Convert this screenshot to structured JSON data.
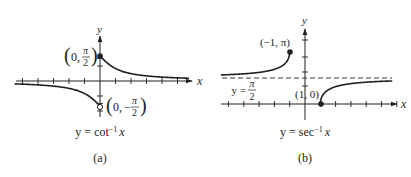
{
  "panels": [
    {
      "id": "a",
      "function": "arccot",
      "caption_prefix": "y = cot",
      "caption_sup": "−1",
      "caption_var": "x",
      "sublabel": "(a)",
      "axis_x_label": "x",
      "axis_y_label": "y",
      "points": [
        {
          "name": "upper-endpoint",
          "x": "0",
          "y_num": "π",
          "y_den": "2",
          "sign": "",
          "filled": true
        },
        {
          "name": "lower-endpoint",
          "x": "0",
          "y_num": "π",
          "y_den": "2",
          "sign": "−",
          "filled": false
        }
      ]
    },
    {
      "id": "b",
      "function": "arcsec",
      "caption_prefix": "y = sec",
      "caption_sup": "−1",
      "caption_var": "x",
      "sublabel": "(b)",
      "axis_x_label": "x",
      "axis_y_label": "y",
      "points": [
        {
          "name": "left-endpoint",
          "label": "(−1, π)",
          "filled": true
        },
        {
          "name": "right-endpoint",
          "label": "(1, 0)",
          "filled": true
        }
      ],
      "asymptote": {
        "prefix": "y =",
        "num": "π",
        "den": "2"
      }
    }
  ],
  "colors": {
    "ink": "#231f20",
    "background": "#ffffff"
  }
}
